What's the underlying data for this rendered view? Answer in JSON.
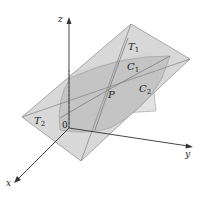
{
  "diagram": {
    "axes": {
      "z_label": "z",
      "y_label": "y",
      "x_label": "x",
      "origin_label": "0"
    },
    "labels": {
      "T1": {
        "base": "T",
        "sub": "1"
      },
      "T2": {
        "base": "T",
        "sub": "2"
      },
      "C1": {
        "base": "C",
        "sub": "1"
      },
      "C2": {
        "base": "C",
        "sub": "2"
      },
      "P": "P"
    },
    "colors": {
      "plane_fill": "#d4d4d4",
      "surface_fill": "#bdbdbd",
      "back_surface_fill": "#e2e2e2",
      "edge": "#8a8a8a",
      "axis": "#333333"
    }
  }
}
